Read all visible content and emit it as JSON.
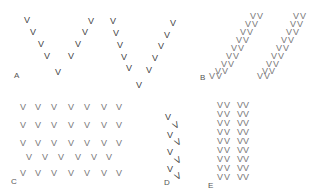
{
  "glyph": "V",
  "labels": {
    "a": "A",
    "b": "B",
    "c": "C",
    "d": "D",
    "e": "E"
  },
  "panels": {
    "A": {
      "description": "two large open V formations",
      "count": 20
    },
    "B": {
      "description": "two parallel diagonal echelons of paired birds",
      "count": 36
    },
    "C": {
      "description": "loose grid of birds in rows",
      "rows": [
        7,
        7,
        7,
        6,
        7
      ]
    },
    "D": {
      "description": "tight staggered column, tilted glyphs",
      "count": 10
    },
    "E": {
      "description": "two columns of doubled pairs",
      "rows": 9,
      "row_text": "VV VV"
    }
  }
}
